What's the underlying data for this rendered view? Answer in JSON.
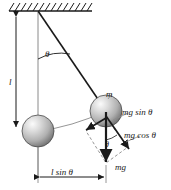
{
  "figure": {
    "labels": {
      "length": "l",
      "angle": "θ",
      "angle_force": "θ",
      "mass": "m",
      "force_tangential": "mg sin θ",
      "force_radial": "mg cos θ",
      "force_weight": "mg",
      "horizontal_displacement": "l sin θ"
    },
    "colors": {
      "stroke": "#1a1a1a",
      "bob_light": "#f2f2f2",
      "bob_mid": "#b8b8b8",
      "bob_dark": "#6e6e6e",
      "thin_line": "#8a8a8a",
      "dashed": "#8a8a8a",
      "background": "#ffffff"
    },
    "geometry": {
      "pivot": [
        38,
        11
      ],
      "bob_rest_center": [
        38,
        131
      ],
      "bob_swing_center": [
        106,
        111
      ],
      "bob_radius": 16,
      "string_length": 120,
      "ceiling_y": 11,
      "ceiling_x_start": 9,
      "ceiling_x_end": 92
    }
  }
}
